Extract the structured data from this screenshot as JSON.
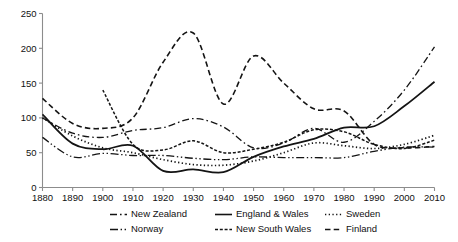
{
  "chart_data": {
    "type": "line",
    "title": "",
    "subtitle": "",
    "xlabel": "",
    "ylabel": "",
    "xlim": [
      1880,
      2010
    ],
    "ylim": [
      0,
      250
    ],
    "grid": false,
    "legend_position": "bottom",
    "xticks": [
      1880,
      1890,
      1900,
      1910,
      1920,
      1930,
      1940,
      1950,
      1960,
      1970,
      1980,
      1990,
      2000,
      2010
    ],
    "yticks": [
      0,
      50,
      100,
      150,
      200,
      250
    ],
    "xtick_labels": [
      "1880",
      "1890",
      "1900",
      "1910",
      "1920",
      "1930",
      "1940",
      "1950",
      "1960",
      "1970",
      "1980",
      "1990",
      "2000",
      "2010"
    ],
    "ytick_labels": [
      "0",
      "50",
      "100",
      "150",
      "200",
      "250"
    ],
    "series": [
      {
        "name": "New Zealand",
        "style": "dash-dot",
        "dasharray": "7,3,1.6,3",
        "width": 1.3,
        "color": "#141414",
        "x": [
          1880,
          1890,
          1900,
          1910,
          1920,
          1930,
          1940,
          1950,
          1960,
          1970,
          1980,
          1990,
          2000,
          2010
        ],
        "values": [
          100,
          78,
          72,
          82,
          86,
          99,
          87,
          57,
          64,
          85,
          65,
          95,
          140,
          202
        ]
      },
      {
        "name": "England & Wales",
        "style": "solid",
        "dasharray": "none",
        "width": 1.8,
        "color": "#141414",
        "x": [
          1880,
          1890,
          1900,
          1910,
          1920,
          1930,
          1940,
          1950,
          1960,
          1970,
          1980,
          1990,
          2000,
          2010
        ],
        "values": [
          105,
          63,
          55,
          60,
          24,
          26,
          22,
          44,
          59,
          70,
          86,
          88,
          117,
          152
        ]
      },
      {
        "name": "Sweden",
        "style": "dotted",
        "dasharray": "1.3,2.4",
        "width": 1.7,
        "color": "#141414",
        "x": [
          1880,
          1890,
          1900,
          1910,
          1920,
          1930,
          1940,
          1950,
          1960,
          1970,
          1980,
          1990,
          2000,
          2010
        ],
        "values": [
          100,
          74,
          57,
          50,
          40,
          33,
          32,
          38,
          50,
          64,
          60,
          56,
          62,
          75
        ]
      },
      {
        "name": "Norway",
        "style": "dash-dot-dot",
        "dasharray": "8,2.6,1.4,2.6,1.4,2.6",
        "width": 1.3,
        "color": "#141414",
        "x": [
          1880,
          1890,
          1900,
          1910,
          1920,
          1930,
          1940,
          1950,
          1960,
          1970,
          1980,
          1990,
          2000,
          2010
        ],
        "values": [
          72,
          44,
          49,
          46,
          46,
          42,
          40,
          44,
          43,
          43,
          43,
          52,
          58,
          58
        ]
      },
      {
        "name": "New South Wales",
        "style": "dense-dash",
        "dasharray": "3,1.8",
        "width": 1.5,
        "color": "#141414",
        "x": [
          1900,
          1910,
          1920,
          1930,
          1940,
          1950,
          1960,
          1970,
          1980,
          1990,
          2000,
          2010
        ],
        "values": [
          140,
          62,
          54,
          67,
          50,
          55,
          65,
          83,
          80,
          62,
          56,
          68
        ]
      },
      {
        "name": "Finland",
        "style": "dashed",
        "dasharray": "5.5,3.2",
        "width": 1.6,
        "color": "#141414",
        "x": [
          1880,
          1890,
          1900,
          1910,
          1920,
          1930,
          1940,
          1950,
          1960,
          1970,
          1980,
          1990,
          2000,
          2010
        ],
        "values": [
          128,
          92,
          85,
          100,
          180,
          222,
          120,
          189,
          150,
          113,
          110,
          62,
          57,
          59
        ]
      }
    ],
    "legend": [
      {
        "label": "New Zealand",
        "style": "dash-dot"
      },
      {
        "label": "England & Wales",
        "style": "solid"
      },
      {
        "label": "Sweden",
        "style": "dotted"
      },
      {
        "label": "Norway",
        "style": "dash-dot-dot"
      },
      {
        "label": "New South Wales",
        "style": "dense-dash"
      },
      {
        "label": "Finland",
        "style": "dashed"
      }
    ]
  }
}
